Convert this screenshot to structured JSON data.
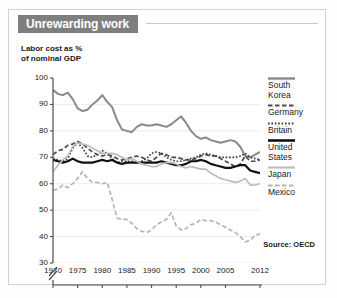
{
  "figure": {
    "title": "Unrewarding work",
    "source": "Source: OECD",
    "banner_color": "#7f7f7f",
    "frame_color": "#d2d2d2"
  },
  "chart_data": {
    "type": "line",
    "title": "Unrewarding work",
    "subtitle": "Labor cost as %\nof nominal GDP",
    "xlabel": "",
    "ylabel": "Labor cost as % of nominal GDP",
    "ylim": [
      30,
      100
    ],
    "xlim": [
      1970,
      2012
    ],
    "yticks": [
      100,
      90,
      80,
      70,
      60,
      50,
      40,
      30
    ],
    "xticks": [
      1970,
      1975,
      1980,
      1985,
      1990,
      1995,
      2000,
      2005,
      2012
    ],
    "axis_break": true,
    "grid": true,
    "grid_axis": "y",
    "legend_position": "right",
    "source": "Source: OECD",
    "x": [
      1970,
      1971,
      1972,
      1973,
      1974,
      1975,
      1976,
      1977,
      1978,
      1979,
      1980,
      1981,
      1982,
      1983,
      1984,
      1985,
      1986,
      1987,
      1988,
      1989,
      1990,
      1991,
      1992,
      1993,
      1994,
      1995,
      1996,
      1997,
      1998,
      1999,
      2000,
      2001,
      2002,
      2003,
      2004,
      2005,
      2006,
      2007,
      2008,
      2009,
      2010,
      2011,
      2012
    ],
    "series": [
      {
        "name": "South Korea",
        "color": "#8a8a8a",
        "style": "solid",
        "width": 2.0,
        "values": [
          95.5,
          94.0,
          93.5,
          94.5,
          92.0,
          88.5,
          87.5,
          88.0,
          90.0,
          91.5,
          93.5,
          91.0,
          89.0,
          84.0,
          80.5,
          80.0,
          79.5,
          81.5,
          82.5,
          82.0,
          82.0,
          82.5,
          82.0,
          81.5,
          82.5,
          84.0,
          85.5,
          83.0,
          80.0,
          78.0,
          77.0,
          77.5,
          76.5,
          76.0,
          75.5,
          76.0,
          76.5,
          76.0,
          74.0,
          70.5,
          70.0,
          71.0,
          72.0
        ]
      },
      {
        "name": "Germany",
        "color": "#4a4a4a",
        "style": "dashed",
        "width": 1.7,
        "values": [
          71.0,
          72.5,
          73.0,
          74.5,
          75.0,
          76.0,
          75.0,
          73.5,
          72.0,
          71.0,
          70.5,
          71.0,
          70.5,
          69.5,
          69.0,
          69.5,
          70.0,
          70.5,
          70.0,
          69.0,
          68.5,
          70.0,
          71.5,
          71.0,
          70.0,
          70.0,
          69.5,
          69.0,
          69.0,
          69.5,
          70.5,
          71.0,
          70.5,
          70.5,
          69.5,
          68.5,
          67.5,
          66.5,
          67.5,
          70.5,
          68.5,
          68.5,
          69.0
        ]
      },
      {
        "name": "Britain",
        "color": "#3a3a3a",
        "style": "dotted",
        "width": 1.7,
        "values": [
          69.5,
          69.0,
          68.5,
          69.5,
          73.5,
          75.5,
          73.5,
          70.5,
          70.0,
          71.0,
          72.5,
          71.5,
          69.5,
          68.0,
          68.5,
          68.5,
          68.5,
          68.0,
          68.5,
          69.5,
          71.5,
          72.0,
          71.5,
          70.0,
          69.0,
          68.5,
          68.5,
          69.0,
          69.5,
          70.0,
          71.0,
          71.5,
          71.0,
          70.5,
          70.0,
          70.0,
          70.0,
          70.0,
          70.5,
          71.5,
          70.0,
          69.5,
          69.0
        ]
      },
      {
        "name": "United States",
        "color": "#111111",
        "style": "solid",
        "width": 2.2,
        "values": [
          69.0,
          68.5,
          68.0,
          68.5,
          69.5,
          68.5,
          68.0,
          68.0,
          68.0,
          68.5,
          69.0,
          68.5,
          69.0,
          68.0,
          67.5,
          68.0,
          68.0,
          68.0,
          68.0,
          68.0,
          68.0,
          68.0,
          68.5,
          68.0,
          67.5,
          67.0,
          67.0,
          67.5,
          68.5,
          68.5,
          69.0,
          68.5,
          67.5,
          67.0,
          66.5,
          66.0,
          66.0,
          66.5,
          67.0,
          67.0,
          65.0,
          64.5,
          64.0
        ]
      },
      {
        "name": "Japan",
        "color": "#bdbdbd",
        "style": "solid",
        "width": 1.7,
        "values": [
          64.5,
          67.0,
          69.0,
          70.5,
          74.0,
          75.5,
          75.0,
          74.5,
          73.5,
          72.5,
          71.5,
          71.5,
          71.5,
          71.0,
          70.0,
          69.0,
          69.5,
          68.5,
          67.5,
          67.0,
          66.5,
          66.5,
          67.5,
          68.0,
          68.0,
          67.5,
          66.5,
          66.0,
          66.5,
          66.0,
          65.5,
          65.5,
          64.0,
          63.0,
          62.0,
          61.5,
          61.0,
          60.5,
          61.0,
          62.0,
          59.5,
          59.5,
          60.0
        ]
      },
      {
        "name": "Mexico",
        "color": "#b5b5b5",
        "style": "dashed",
        "width": 1.7,
        "values": [
          57.5,
          58.0,
          59.5,
          58.5,
          60.0,
          62.0,
          64.5,
          62.0,
          60.5,
          60.5,
          60.0,
          60.5,
          54.0,
          47.0,
          46.5,
          46.5,
          45.0,
          43.0,
          42.0,
          41.5,
          42.5,
          44.5,
          45.5,
          46.5,
          49.0,
          44.0,
          42.5,
          43.0,
          44.5,
          45.0,
          46.5,
          46.0,
          46.0,
          45.5,
          44.5,
          43.5,
          42.5,
          41.5,
          40.0,
          38.0,
          38.5,
          40.5,
          41.0
        ]
      }
    ]
  },
  "legend": {
    "items": [
      {
        "label": "South\nKorea",
        "series": "South Korea"
      },
      {
        "label": "Germany",
        "series": "Germany"
      },
      {
        "label": "Britain",
        "series": "Britain"
      },
      {
        "label": "United\nStates",
        "series": "United States"
      },
      {
        "label": "Japan",
        "series": "Japan"
      },
      {
        "label": "Mexico",
        "series": "Mexico"
      }
    ]
  }
}
